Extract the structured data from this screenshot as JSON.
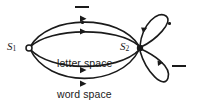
{
  "diagram": {
    "type": "state-transition-graph",
    "stroke_color": "#1a1a1a",
    "background": "#ffffff",
    "nodes": [
      {
        "id": "s1",
        "label": "S",
        "subscript": "1",
        "x": 29,
        "y": 48,
        "filled": false
      },
      {
        "id": "s2",
        "label": "S",
        "subscript": "2",
        "x": 140,
        "y": 48,
        "filled": true
      }
    ],
    "edges": [
      {
        "id": "e1",
        "from": "s1",
        "to": "s2",
        "label_type": "dash",
        "label_text": "—",
        "position": "above-top-arc"
      },
      {
        "id": "e2",
        "from": "s1",
        "to": "s2",
        "label_type": "dot",
        "label_text": "·",
        "position": "above-second-arc"
      },
      {
        "id": "e3",
        "from": "s1",
        "to": "s2",
        "label_type": "text",
        "label_text": "letter space",
        "position": "inside-center"
      },
      {
        "id": "e4",
        "from": "s1",
        "to": "s2",
        "label_type": "text",
        "label_text": "word space",
        "position": "below-bottom-arc"
      },
      {
        "id": "e5",
        "from": "s2",
        "to": "s2",
        "label_type": "dot",
        "label_text": "·",
        "position": "upper-right-loop"
      },
      {
        "id": "e6",
        "from": "s2",
        "to": "s2",
        "label_type": "dash",
        "label_text": "—",
        "position": "lower-right-loop"
      }
    ],
    "labels": {
      "letter_space": "letter space",
      "word_space": "word space",
      "dash_glyph": "—",
      "dot_glyph": "·",
      "s1_name": "S",
      "s1_sub": "1",
      "s2_name": "S",
      "s2_sub": "2"
    }
  }
}
